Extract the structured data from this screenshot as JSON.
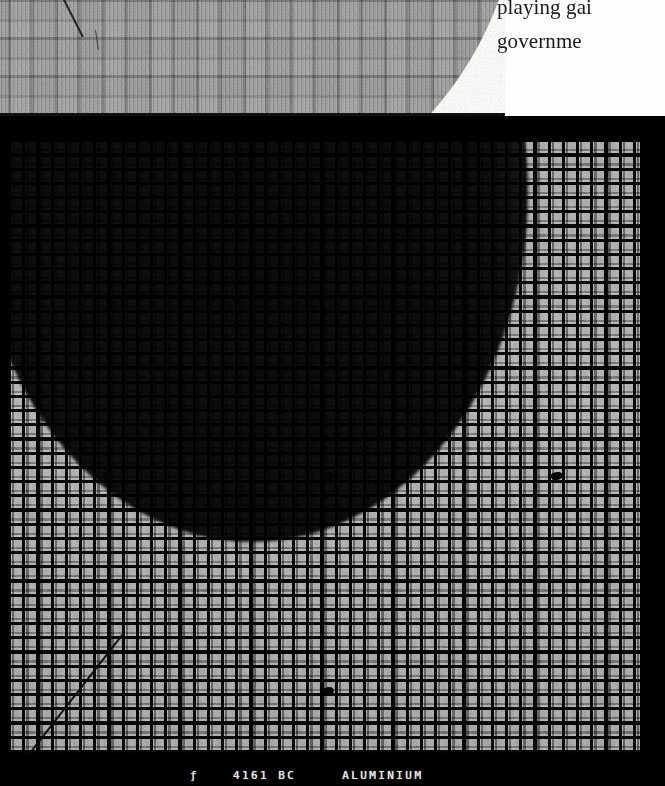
{
  "page": {
    "background_color": "#fdfdfb",
    "kind": "scanned-book-page"
  },
  "body_text": {
    "lines": [
      "playing gai",
      "governme"
    ]
  },
  "photo_top": {
    "name": "magnified-die-detail",
    "description": "magnified wafer die pattern, light grey, curved right edge",
    "defect_annotation": "diagonal-scratch"
  },
  "photo_main": {
    "name": "wafer-die-map",
    "description": "full wafer die array with dark circular shadow region",
    "frame_color": "#000000",
    "die_color": "#9d9d9d",
    "shadow_color": "#000000",
    "defects": [
      {
        "label": "defect-mark-left",
        "x": 103,
        "y": 461
      },
      {
        "label": "defect-mark-center",
        "x": 323,
        "y": 461
      },
      {
        "label": "defect-mark-right",
        "x": 551,
        "y": 461
      },
      {
        "label": "defect-mark-lower-center",
        "x": 323,
        "y": 676
      }
    ],
    "scratch": "diagonal-scratch-lower-left"
  },
  "caption": {
    "symbol": "ƒ",
    "number": "4161 BC",
    "material": "ALUMINIUM"
  }
}
